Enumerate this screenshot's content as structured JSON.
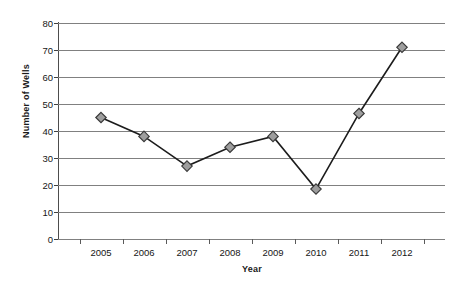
{
  "chart_data": {
    "type": "line",
    "title": "",
    "xlabel": "Year",
    "ylabel": "Number of Wells",
    "categories": [
      "2005",
      "2006",
      "2007",
      "2008",
      "2009",
      "2010",
      "2011",
      "2012"
    ],
    "values": [
      45,
      38,
      27,
      34,
      38,
      18.5,
      46.5,
      71
    ],
    "series": [
      {
        "name": "Number of Wells",
        "values": [
          45,
          38,
          27,
          34,
          38,
          18.5,
          46.5,
          71
        ]
      }
    ],
    "ylim": [
      0,
      80
    ],
    "y_ticks": [
      0,
      10,
      20,
      30,
      40,
      50,
      60,
      70,
      80
    ],
    "y_tick_labels": [
      "0",
      "10",
      "20",
      "30",
      "40",
      "50",
      "60",
      "70",
      "80"
    ],
    "grid": true,
    "legend": false,
    "marker": "diamond",
    "line_color": "#1c1c1c",
    "marker_fill": "#9e9e9e",
    "marker_edge": "#3a3a3a",
    "gridline_color": "#808080",
    "background": "#ffffff"
  }
}
